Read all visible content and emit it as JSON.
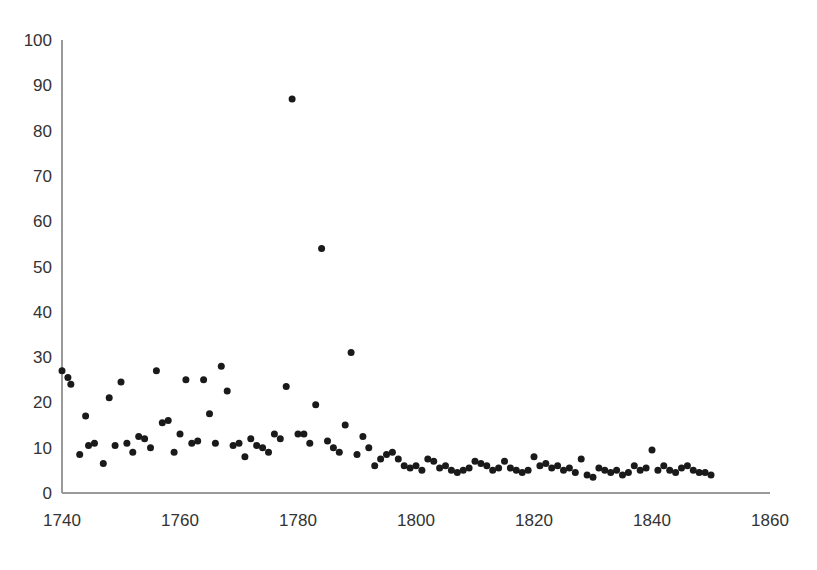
{
  "chart_data": {
    "type": "scatter",
    "title": "",
    "subtitle": "",
    "xlabel": "",
    "ylabel": "",
    "xlim": [
      1740,
      1860
    ],
    "ylim": [
      0,
      100
    ],
    "grid": false,
    "legend": null,
    "xticks": [
      1740,
      1760,
      1780,
      1800,
      1820,
      1840,
      1860
    ],
    "yticks": [
      0,
      10,
      20,
      30,
      40,
      50,
      60,
      70,
      80,
      90,
      100
    ],
    "xtick_labels": [
      "1740",
      "1760",
      "1780",
      "1800",
      "1820",
      "1840",
      "1860"
    ],
    "ytick_labels": [
      "0",
      "10",
      "20",
      "30",
      "40",
      "50",
      "60",
      "70",
      "80",
      "90",
      "100"
    ],
    "marker": "circle",
    "marker_color": "#1a1a1a",
    "marker_size": 7,
    "axis_color": "#9a9a9a",
    "background_color": "#ffffff",
    "series": [
      {
        "name": "observations",
        "x": [
          1740,
          1741,
          1741.5,
          1743,
          1744,
          1744.5,
          1745.5,
          1747,
          1748,
          1749,
          1750,
          1751,
          1752,
          1753,
          1754,
          1755,
          1756,
          1757,
          1758,
          1759,
          1760,
          1761,
          1762,
          1763,
          1764,
          1765,
          1766,
          1767,
          1768,
          1769,
          1770,
          1771,
          1772,
          1773,
          1774,
          1775,
          1776,
          1777,
          1778,
          1779,
          1780,
          1781,
          1782,
          1783,
          1784,
          1785,
          1786,
          1787,
          1788,
          1789,
          1790,
          1791,
          1792,
          1793,
          1794,
          1795,
          1796,
          1797,
          1798,
          1799,
          1800,
          1801,
          1802,
          1803,
          1804,
          1805,
          1806,
          1807,
          1808,
          1809,
          1810,
          1811,
          1812,
          1813,
          1814,
          1815,
          1816,
          1817,
          1818,
          1819,
          1820,
          1821,
          1822,
          1823,
          1824,
          1825,
          1826,
          1827,
          1828,
          1829,
          1830,
          1831,
          1832,
          1833,
          1834,
          1835,
          1836,
          1837,
          1838,
          1839,
          1840,
          1841,
          1842,
          1843,
          1844,
          1845,
          1846,
          1847,
          1848,
          1849,
          1850
        ],
        "y": [
          27,
          25.5,
          24,
          8.5,
          17,
          10.5,
          11,
          6.5,
          21,
          10.5,
          24.5,
          11,
          9,
          12.5,
          12,
          10,
          27,
          15.5,
          16,
          9,
          13,
          25,
          11,
          11.5,
          25,
          17.5,
          11,
          28,
          22.5,
          10.5,
          11,
          8,
          12,
          10.5,
          10,
          9,
          13,
          12,
          23.5,
          87,
          13,
          13,
          11,
          19.5,
          54,
          11.5,
          10,
          9,
          15,
          31,
          8.5,
          12.5,
          10,
          6,
          7.5,
          8.5,
          9,
          7.5,
          6,
          5.5,
          6,
          5,
          7.5,
          7,
          5.5,
          6,
          5,
          4.5,
          5,
          5.5,
          7,
          6.5,
          6,
          5,
          5.5,
          7,
          5.5,
          5,
          4.5,
          5,
          8,
          6,
          6.5,
          5.5,
          6,
          5,
          5.5,
          4.5,
          7.5,
          4,
          3.5,
          5.5,
          5,
          4.5,
          5,
          4,
          4.5,
          6,
          5,
          5.5,
          9.5,
          5,
          6,
          5,
          4.5,
          5.5,
          6,
          5,
          4.5,
          4.5,
          4
        ]
      }
    ]
  }
}
